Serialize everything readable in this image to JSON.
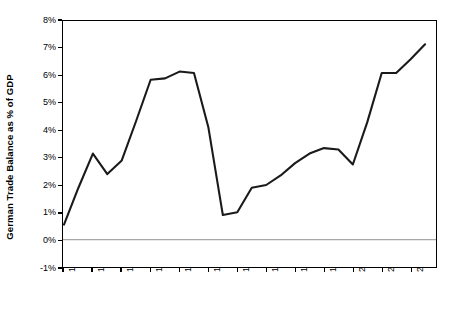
{
  "chart_data": {
    "type": "line",
    "title": "",
    "xlabel": "",
    "ylabel": "German Trade Balance as % of GDP",
    "ylim": [
      -1,
      8
    ],
    "xlim": [
      1980,
      2005
    ],
    "grid": false,
    "legend": null,
    "yticks": [
      "8%",
      "7%",
      "6%",
      "5%",
      "4%",
      "3%",
      "2%",
      "1%",
      "0%",
      "-1%"
    ],
    "ytick_values": [
      8,
      7,
      6,
      5,
      4,
      3,
      2,
      1,
      0,
      -1
    ],
    "xticks": [
      "1980",
      "1982",
      "1984",
      "1986",
      "1988",
      "1990",
      "1992",
      "1994",
      "1996",
      "1998",
      "2000",
      "2002",
      "2004"
    ],
    "xtick_values": [
      1980,
      1982,
      1984,
      1986,
      1988,
      1990,
      1992,
      1994,
      1996,
      1998,
      2000,
      2002,
      2004
    ],
    "zero_line": 0,
    "series": [
      {
        "name": "German Trade Balance as % of GDP",
        "color": "#1a1a1a",
        "x": [
          1980,
          1981,
          1982,
          1983,
          1984,
          1985,
          1986,
          1987,
          1988,
          1989,
          1990,
          1991,
          1992,
          1993,
          1994,
          1995,
          1996,
          1997,
          1998,
          1999,
          2000,
          2001,
          2002,
          2003,
          2004,
          2005
        ],
        "values": [
          0.55,
          1.9,
          3.15,
          2.4,
          2.9,
          4.35,
          5.85,
          5.9,
          6.15,
          6.1,
          4.1,
          0.9,
          1.0,
          1.9,
          2.0,
          2.35,
          2.8,
          3.15,
          3.35,
          3.3,
          2.75,
          4.3,
          6.1,
          6.1,
          6.6,
          7.15
        ]
      }
    ]
  }
}
